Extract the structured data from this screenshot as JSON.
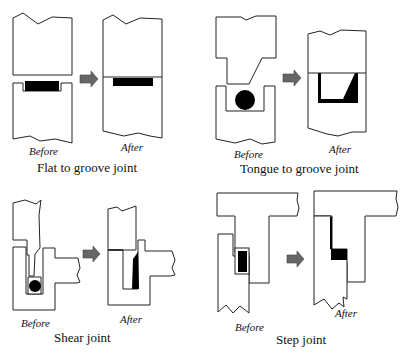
{
  "panels": [
    {
      "id": "flat-to-groove",
      "caption": "Flat to groove joint",
      "before_label": "Before",
      "after_label": "After"
    },
    {
      "id": "tongue-to-groove",
      "caption": "Tongue to groove joint",
      "before_label": "Before",
      "after_label": "After"
    },
    {
      "id": "shear",
      "caption": "Shear joint",
      "before_label": "Before",
      "after_label": "After"
    },
    {
      "id": "step",
      "caption": "Step joint",
      "before_label": "Before",
      "after_label": "After"
    }
  ],
  "colors": {
    "line": "#222222",
    "fill_black": "#000000",
    "arrow": "#666666",
    "background": "#ffffff"
  }
}
